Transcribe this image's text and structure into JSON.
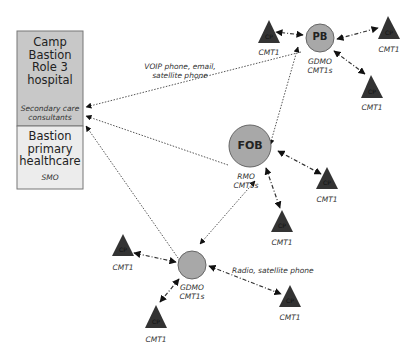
{
  "diagram": {
    "boxes": {
      "hospital": {
        "title": "Camp Bastion Role 3 hospital",
        "lines": [
          "Camp",
          "Bastion",
          "Role 3",
          "hospital"
        ],
        "subtitle_lines": [
          "Secondary care",
          "consultants"
        ],
        "fill": "#c8c8c8"
      },
      "primary": {
        "lines": [
          "Bastion",
          "primary",
          "healthcare"
        ],
        "subtitle": "SMO",
        "fill": "#ececec"
      }
    },
    "nodes": {
      "pb": {
        "label": "PB",
        "sub": [
          "GDMO",
          "CMT1s"
        ]
      },
      "fob": {
        "label": "FOB",
        "sub": [
          "RMO",
          "CMT1s"
        ]
      },
      "gdmo_bottom": {
        "label": "",
        "sub": [
          "GDMO",
          "CMT1s"
        ]
      }
    },
    "cp_label": "CP",
    "cmt1_label": "CMT1",
    "link_labels": {
      "voip": [
        "VOIP phone, email,",
        "satellite phone"
      ],
      "radio": "Radio, satellite phone"
    },
    "colors": {
      "node_fill": "#a8a8a8",
      "triangle": "#333333",
      "line": "#555555"
    }
  }
}
